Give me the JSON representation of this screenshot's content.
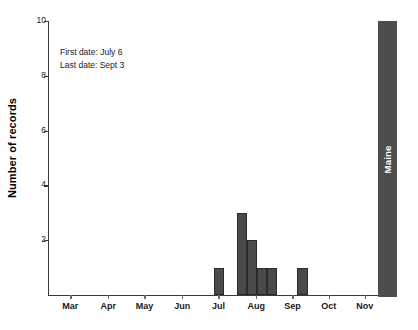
{
  "chart_data": {
    "type": "bar",
    "title": "",
    "subtitle": "",
    "xlabel": "",
    "ylabel": "Number of records",
    "ylim": [
      0,
      10
    ],
    "yticks": [
      2,
      4,
      6,
      8,
      10
    ],
    "ytick_labels": [
      "2",
      "4",
      "6",
      "8",
      "10"
    ],
    "grid": false,
    "legend": "none",
    "xtick_labels": [
      "Mar",
      "Apr",
      "May",
      "Jun",
      "Jul",
      "Aug",
      "Sep",
      "Oct",
      "Nov"
    ],
    "xtick_positions_pct": [
      6.5,
      18.0,
      29.0,
      40.5,
      51.5,
      63.0,
      74.0,
      85.0,
      96.0
    ],
    "categories": [
      "Jul wk1",
      "Jul wk3",
      "Jul wk4",
      "Aug wk1",
      "Aug wk2",
      "Sep wk1"
    ],
    "values": [
      1,
      3,
      2,
      1,
      1,
      1
    ],
    "bars": [
      {
        "label": "Jul wk1",
        "value": 1,
        "left_pct": 50.0,
        "width_pct": 3.1
      },
      {
        "label": "Jul wk3",
        "value": 3,
        "left_pct": 57.0,
        "width_pct": 3.1
      },
      {
        "label": "Jul wk4",
        "value": 2,
        "left_pct": 60.1,
        "width_pct": 3.1
      },
      {
        "label": "Aug wk1",
        "value": 1,
        "left_pct": 63.2,
        "width_pct": 3.1
      },
      {
        "label": "Aug wk2",
        "value": 1,
        "left_pct": 66.3,
        "width_pct": 3.1
      },
      {
        "label": "Sep wk1",
        "value": 1,
        "left_pct": 75.5,
        "width_pct": 3.1
      }
    ],
    "annotations": [
      "First date: July 6",
      "Last date: Sept 3"
    ],
    "state_band_label": "Maine",
    "colors": {
      "bar_fill": "#4a4a4a",
      "bar_edge": "#2a2a2a",
      "band_fill": "#4d4d4d",
      "band_text": "#ffffff",
      "axis": "#3a3a3a",
      "background": "#ffffff"
    }
  },
  "axis": {
    "y_title": "Number of records"
  },
  "annotation": {
    "line1": "First date: July 6",
    "line2": "Last date: Sept 3"
  },
  "band": {
    "label": "Maine"
  }
}
